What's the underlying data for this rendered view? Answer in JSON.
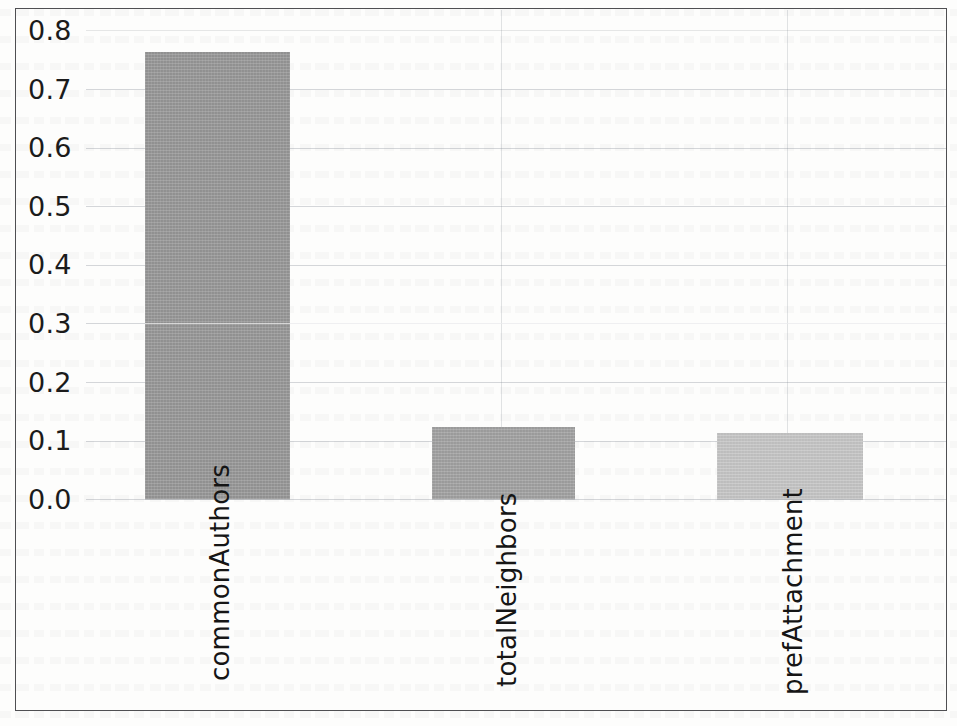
{
  "figure": {
    "kind": "scanned-bar-chart",
    "border_color": "#4f4f52",
    "background_color": "#fdfdfc"
  },
  "chart_data": {
    "type": "bar",
    "title": "",
    "subtitle": "",
    "xlabel": "",
    "ylabel": "",
    "categories": [
      "commonAuthors",
      "totalNeighbors",
      "prefAttachment"
    ],
    "values": [
      0.763,
      0.123,
      0.113
    ],
    "series": [
      {
        "name": "importance",
        "values": [
          0.763,
          0.123,
          0.113
        ]
      }
    ],
    "bar_colors": [
      "#989898",
      "#a2a2a2",
      "#c7c7c7"
    ],
    "ylim": [
      0.0,
      0.8
    ],
    "y_ticks": [
      0.0,
      0.1,
      0.2,
      0.3,
      0.4,
      0.5,
      0.6,
      0.7,
      0.8
    ],
    "y_tick_labels": [
      "0.0",
      "0.1",
      "0.2",
      "0.3",
      "0.4",
      "0.5",
      "0.6",
      "0.7",
      "0.8"
    ],
    "x_tick_labels": [
      "commonAuthors",
      "totalNeighbors",
      "prefAttachment"
    ],
    "x_tick_rotation": 90,
    "grid": true,
    "grid_axis": "y",
    "grid_color": "#b9bcc2",
    "legend": false,
    "legend_position": "none",
    "annotations": []
  },
  "axis": {
    "y_labels": {
      "t0": "0.0",
      "t1": "0.1",
      "t2": "0.2",
      "t3": "0.3",
      "t4": "0.4",
      "t5": "0.5",
      "t6": "0.6",
      "t7": "0.7",
      "t8": "0.8"
    },
    "x_labels": {
      "b0": "commonAuthors",
      "b1": "totalNeighbors",
      "b2": "prefAttachment"
    }
  }
}
